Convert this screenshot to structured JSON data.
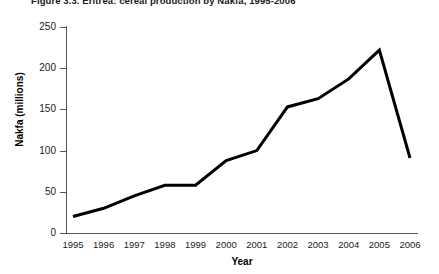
{
  "figure": {
    "title": "Figure 3.3.  Eritrea: cereal production by Nakfa, 1995-2006"
  },
  "chart_data": {
    "type": "line",
    "title": "Figure 3.3.  Eritrea: cereal production by Nakfa, 1995-2006",
    "xlabel": "Year",
    "ylabel": "Nakfa (millions)",
    "categories": [
      "1995",
      "1996",
      "1997",
      "1998",
      "1999",
      "2000",
      "2001",
      "2002",
      "2003",
      "2004",
      "2005",
      "2006"
    ],
    "values": [
      20,
      30,
      45,
      58,
      58,
      88,
      100,
      153,
      163,
      187,
      222,
      91
    ],
    "yticks": [
      0,
      50,
      100,
      150,
      200,
      250
    ],
    "ylim": [
      0,
      250
    ],
    "grid": false,
    "legend": false,
    "line_color": "#000000",
    "line_width": 3
  }
}
